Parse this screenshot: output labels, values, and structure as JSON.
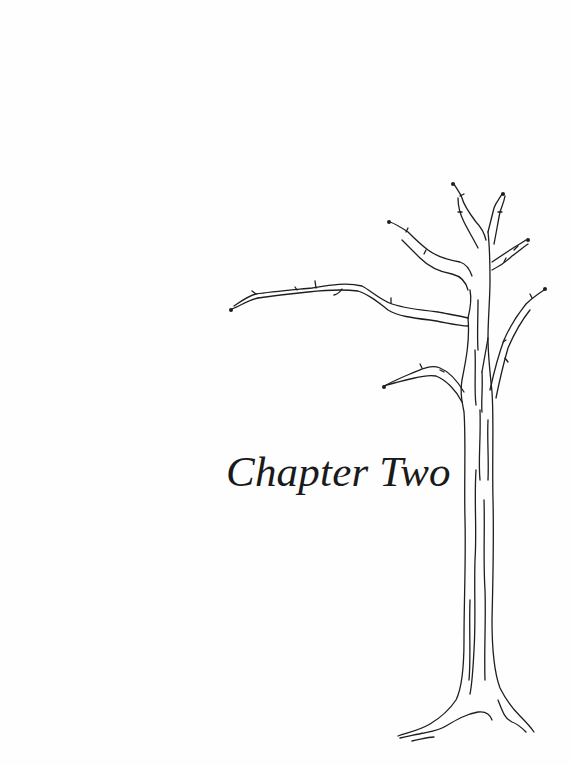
{
  "page": {
    "background": "#ffffff",
    "ink_color": "#1e1e1e"
  },
  "chapter": {
    "title": "Chapter Two"
  },
  "illustration": {
    "subject": "bare-tree-line-drawing"
  }
}
